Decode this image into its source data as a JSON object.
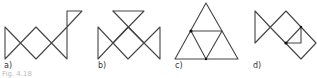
{
  "figure": {
    "caption": "Fig. 4.18",
    "panels": [
      {
        "id": "a",
        "label": "a)"
      },
      {
        "id": "b",
        "label": "b)"
      },
      {
        "id": "c",
        "label": "c)"
      },
      {
        "id": "d",
        "label": "d)"
      }
    ],
    "colors": {
      "line": "#444444",
      "dot": "#111111"
    }
  }
}
